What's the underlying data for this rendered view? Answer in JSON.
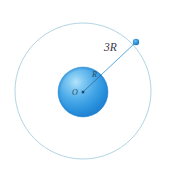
{
  "figure": {
    "background_color": "#ffffff",
    "labels": {
      "outer_radius": "3R",
      "inner_radius": "R",
      "center": "O"
    },
    "colors": {
      "orbit_stroke": "#aacfe0",
      "sphere_light": "#8fd0f2",
      "sphere_mid": "#3ca0e8",
      "sphere_dark": "#1f7fd0",
      "sphere_edge": "#2f93dd",
      "radius_line": "#5aa8dc",
      "point_marker": "#2d8fd6",
      "label_text": "#3b3b4a"
    },
    "geometry": {
      "orbit_center_x": 83,
      "orbit_center_y": 91,
      "orbit_radius": 68,
      "sphere_center_x": 83,
      "sphere_center_y": 92,
      "sphere_radius": 25,
      "point_x": 136,
      "point_y": 42,
      "point_marker_radius": 3
    }
  }
}
